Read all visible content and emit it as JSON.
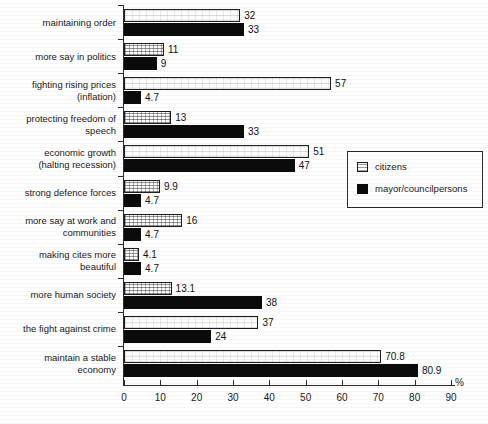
{
  "chart_data": {
    "type": "bar",
    "orientation": "horizontal",
    "title": "",
    "xlabel": "%",
    "ylabel": "",
    "xlim": [
      0,
      90
    ],
    "xticks": [
      0,
      10,
      20,
      30,
      40,
      50,
      60,
      70,
      80,
      90
    ],
    "grid": false,
    "legend_position": "center-right",
    "categories": [
      "maintaining order",
      "more say in politics",
      "fighting rising prices\n(inflation)",
      "protecting freedom of\nspeech",
      "economic growth\n(halting recession)",
      "strong defence forces",
      "more say at work and\ncommunities",
      "making cites more\nbeautiful",
      "more human society",
      "the fight against crime",
      "maintain a stable\neconomy"
    ],
    "series": [
      {
        "name": "citizens",
        "color": "#fdfdfd",
        "values": [
          32,
          11,
          57,
          13,
          51,
          9.9,
          16,
          4.1,
          13.1,
          37,
          70.8
        ],
        "labels": [
          "32",
          "11",
          "57",
          "13",
          "51",
          "9.9",
          "16",
          "4.1",
          "13.1",
          "37",
          "70.8"
        ]
      },
      {
        "name": "mayor/councilpersons",
        "color": "#0b0b0b",
        "values": [
          33,
          9,
          4.7,
          33,
          47,
          4.7,
          4.7,
          4.7,
          38,
          24,
          80.9
        ],
        "labels": [
          "33",
          "9",
          "4.7",
          "33",
          "47",
          "4.7",
          "4.7",
          "4.7",
          "38",
          "24",
          "80.9"
        ]
      }
    ]
  },
  "legend": {
    "items": [
      {
        "label": "citizens",
        "swatch": "citizens-swatch-icon"
      },
      {
        "label": "mayor/councilpersons",
        "swatch": "mayor-swatch-icon"
      }
    ]
  },
  "axis": {
    "unit": "%",
    "tick_labels": [
      "0",
      "10",
      "20",
      "30",
      "40",
      "50",
      "60",
      "70",
      "80",
      "90"
    ]
  }
}
